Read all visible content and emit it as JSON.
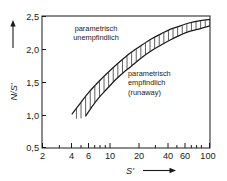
{
  "figure": {
    "background_color": "#ffffff",
    "line_color": "#1a1a1a",
    "caption_fragment": ""
  },
  "chart_data": {
    "type": "line",
    "title": "",
    "xlabel": "S'",
    "ylabel": "N/S'",
    "xscale": "log",
    "yscale": "linear",
    "xlim": [
      2,
      100
    ],
    "ylim": [
      0.5,
      2.5
    ],
    "grid": false,
    "legend": null,
    "xticks": [
      2,
      4,
      6,
      10,
      20,
      40,
      60,
      100
    ],
    "xtick_labels": [
      "2",
      "4",
      "6",
      "10",
      "20",
      "40",
      "60",
      "100"
    ],
    "xminor_ticks": [
      3,
      5,
      7,
      8,
      9,
      30,
      50,
      70,
      80,
      90
    ],
    "yticks": [
      0.5,
      1.0,
      1.5,
      2.0,
      2.5
    ],
    "ytick_labels": [
      "0,5",
      "1,0",
      "1,5",
      "2,0",
      "2,5"
    ],
    "series": [
      {
        "name": "upper-boundary",
        "points": [
          [
            4.0,
            1.01
          ],
          [
            5.0,
            1.2
          ],
          [
            6.0,
            1.35
          ],
          [
            7.0,
            1.46
          ],
          [
            8.0,
            1.55
          ],
          [
            10.0,
            1.69
          ],
          [
            13.0,
            1.84
          ],
          [
            16.0,
            1.95
          ],
          [
            20.0,
            2.05
          ],
          [
            26.0,
            2.16
          ],
          [
            32.0,
            2.23
          ],
          [
            40.0,
            2.3
          ],
          [
            50.0,
            2.35
          ],
          [
            60.0,
            2.39
          ],
          [
            80.0,
            2.43
          ],
          [
            100.0,
            2.45
          ]
        ]
      },
      {
        "name": "lower-boundary",
        "points": [
          [
            5.5,
            0.98
          ],
          [
            6.5,
            1.14
          ],
          [
            7.5,
            1.26
          ],
          [
            9.0,
            1.39
          ],
          [
            11.0,
            1.53
          ],
          [
            13.0,
            1.63
          ],
          [
            16.0,
            1.74
          ],
          [
            20.0,
            1.86
          ],
          [
            26.0,
            1.98
          ],
          [
            32.0,
            2.06
          ],
          [
            40.0,
            2.14
          ],
          [
            50.0,
            2.21
          ],
          [
            60.0,
            2.26
          ],
          [
            80.0,
            2.31
          ],
          [
            100.0,
            2.35
          ]
        ]
      }
    ],
    "band": {
      "name": "hatched-transition-band",
      "hatch": "vertical",
      "between": [
        "upper-boundary",
        "lower-boundary"
      ]
    },
    "annotations": [
      {
        "name": "region-insensitive",
        "lines": [
          "parametrisch",
          "unempfindlich"
        ],
        "x": 7.0,
        "y": 2.22
      },
      {
        "name": "region-sensitive",
        "lines": [
          "parametrisch",
          "empfindlich",
          "(runaway)"
        ],
        "x": 26.0,
        "y": 1.52
      }
    ]
  },
  "axes": {
    "y_axis_arrow": "up-arrow",
    "x_axis_arrow": "right-arrow"
  }
}
